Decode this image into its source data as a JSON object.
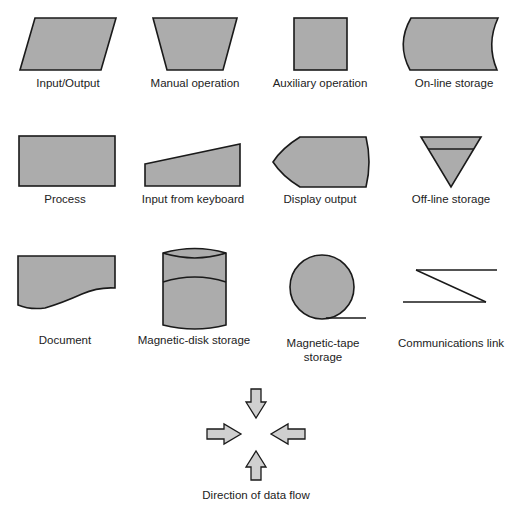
{
  "colors": {
    "fill": "#acacac",
    "stroke": "#1a1a1a",
    "background": "#ffffff"
  },
  "symbols": [
    {
      "id": "input-output",
      "label": "Input/Output"
    },
    {
      "id": "manual-operation",
      "label": "Manual operation"
    },
    {
      "id": "auxiliary-operation",
      "label": "Auxiliary operation"
    },
    {
      "id": "on-line-storage",
      "label": "On-line storage"
    },
    {
      "id": "process",
      "label": "Process"
    },
    {
      "id": "input-from-keyboard",
      "label": "Input from keyboard"
    },
    {
      "id": "display-output",
      "label": "Display output"
    },
    {
      "id": "off-line-storage",
      "label": "Off-line storage"
    },
    {
      "id": "document",
      "label": "Document"
    },
    {
      "id": "magnetic-disk-storage",
      "label": "Magnetic-disk storage"
    },
    {
      "id": "magnetic-tape-storage",
      "label": "Magnetic-tape",
      "label_line2": "storage"
    },
    {
      "id": "communications-link",
      "label": "Communications link"
    },
    {
      "id": "direction-of-data-flow",
      "label": "Direction of data flow"
    }
  ]
}
